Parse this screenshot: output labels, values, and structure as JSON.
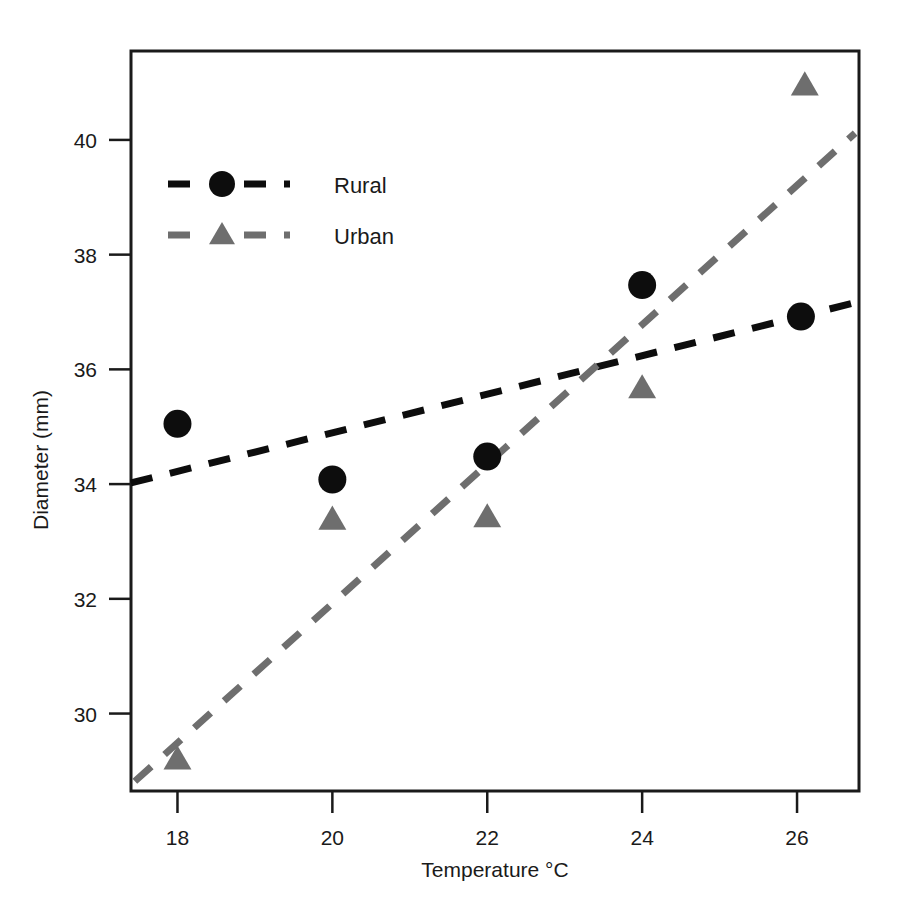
{
  "chart_data": {
    "type": "scatter",
    "title": "",
    "xlabel": "Temperature °C",
    "ylabel": "Diameter (mm)",
    "xlim": [
      17.4,
      26.8
    ],
    "ylim": [
      28.65,
      41.55
    ],
    "xticks": [
      18,
      20,
      22,
      24,
      26
    ],
    "xtick_labels": [
      "18",
      "20",
      "22",
      "24",
      "26"
    ],
    "yticks": [
      30,
      32,
      34,
      36,
      38,
      40
    ],
    "ytick_labels": [
      "30",
      "32",
      "34",
      "36",
      "38",
      "40"
    ],
    "grid": false,
    "legend_position": "upper-left-inside",
    "series": [
      {
        "name": "Rural",
        "marker": "circle",
        "color": "#0d0d0d",
        "linestyle": "dashed",
        "x": [
          18.0,
          20.0,
          22.0,
          24.0,
          26.05
        ],
        "y": [
          35.05,
          34.08,
          34.48,
          37.47,
          36.92
        ],
        "trend": {
          "x_start": 17.4,
          "y_start": 34.02,
          "x_end": 26.8,
          "y_end": 37.18
        }
      },
      {
        "name": "Urban",
        "marker": "triangle",
        "color": "#6e6e6e",
        "linestyle": "dashed",
        "x": [
          18.0,
          20.0,
          22.0,
          24.0,
          26.1
        ],
        "y": [
          29.2,
          33.38,
          33.42,
          35.67,
          40.95
        ],
        "trend": {
          "x_start": 17.45,
          "y_start": 28.82,
          "x_end": 26.75,
          "y_end": 40.12
        }
      }
    ]
  },
  "legend": {
    "items": [
      {
        "label": "Rural",
        "marker": "circle",
        "color": "#0d0d0d"
      },
      {
        "label": "Urban",
        "marker": "triangle",
        "color": "#6e6e6e"
      }
    ]
  },
  "axes": {
    "x_title": "Temperature °C",
    "y_title": "Diameter (mm)"
  },
  "colors": {
    "rural": "#0d0d0d",
    "urban": "#6e6e6e",
    "frame": "#1a1a1a",
    "background": "#ffffff"
  }
}
